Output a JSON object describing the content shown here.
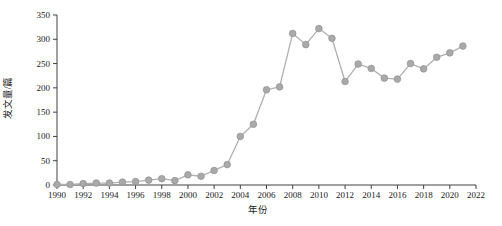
{
  "page": {
    "background_color": "#ffffff"
  },
  "chart_data": {
    "type": "line",
    "title": "",
    "xlabel": "年份",
    "ylabel": "发文量/篇",
    "x": [
      1990,
      1991,
      1992,
      1993,
      1994,
      1995,
      1996,
      1997,
      1998,
      1999,
      2000,
      2001,
      2002,
      2003,
      2004,
      2005,
      2006,
      2007,
      2008,
      2009,
      2010,
      2011,
      2012,
      2013,
      2014,
      2015,
      2016,
      2017,
      2018,
      2019,
      2020,
      2021
    ],
    "values": [
      1,
      1,
      3,
      4,
      4,
      6,
      7,
      10,
      13,
      9,
      21,
      18,
      30,
      42,
      100,
      125,
      196,
      202,
      312,
      289,
      322,
      302,
      213,
      249,
      240,
      220,
      218,
      250,
      239,
      263,
      272,
      286
    ],
    "series_name": "发文量",
    "xlim": [
      1990,
      2022
    ],
    "ylim": [
      0,
      350
    ],
    "xticks": [
      1990,
      1992,
      1994,
      1996,
      1998,
      2000,
      2002,
      2004,
      2006,
      2008,
      2010,
      2012,
      2014,
      2016,
      2018,
      2020,
      2022
    ],
    "xtick_labels": [
      "1990",
      "1992",
      "1994",
      "1996",
      "1998",
      "2000",
      "2002",
      "2004",
      "2006",
      "2008",
      "2010",
      "2012",
      "2014",
      "2016",
      "2018",
      "2020",
      "2022"
    ],
    "yticks": [
      0,
      50,
      100,
      150,
      200,
      250,
      300,
      350
    ],
    "ytick_labels": [
      "0",
      "50",
      "100",
      "150",
      "200",
      "250",
      "300",
      "350"
    ],
    "grid": false,
    "legend": "none",
    "marker": "circle",
    "line_color": "#b0b0b0",
    "marker_fill_color": "#a9a9a9",
    "marker_edge_color": "#969696",
    "axis_color": "#404040",
    "text_color": "#1a1a1a"
  }
}
